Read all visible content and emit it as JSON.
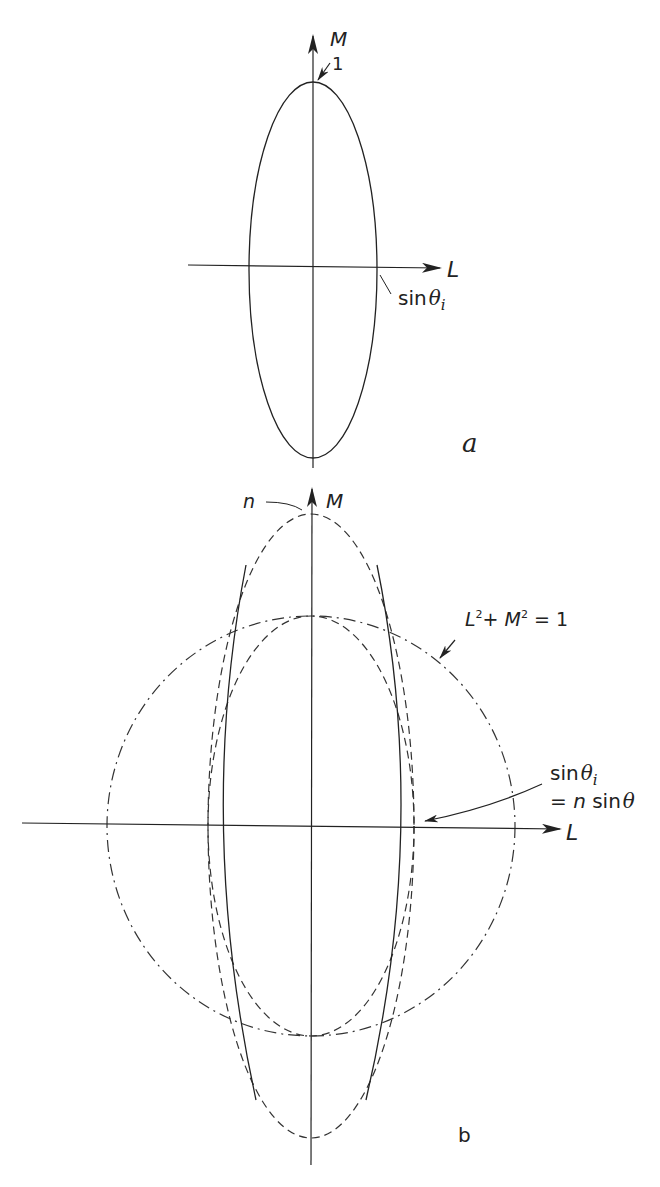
{
  "figure_a": {
    "panel_label": "a",
    "axis_m_label": "M",
    "axis_l_label": "L",
    "top_value_label": "1",
    "intercept_label_prefix": "sin",
    "intercept_label_theta": "θ",
    "intercept_label_sub": "i"
  },
  "figure_b": {
    "panel_label": "b",
    "axis_m_label": "M",
    "axis_l_label": "L",
    "n_label": "n",
    "circle_label": {
      "l": "L",
      "plus": "+ ",
      "m": "M",
      "sup": "2",
      "rhs": " = 1"
    },
    "intercept_label": {
      "line1_prefix": "sin",
      "line1_theta": "θ",
      "line1_sub": "i",
      "line2_eq": "= ",
      "line2_n": "n",
      "line2_sin": " sin",
      "line2_theta": "θ"
    },
    "curves": [
      {
        "name": "unit-circle",
        "style": "dash-dot",
        "equation": "L² + M² = 1"
      },
      {
        "name": "inner-ellipse",
        "style": "dashed"
      },
      {
        "name": "outer-ellipse-n",
        "style": "dashed"
      },
      {
        "name": "solid-lens-curve",
        "style": "solid"
      }
    ]
  },
  "colors": {
    "ink": "#222222",
    "background": "#ffffff"
  }
}
